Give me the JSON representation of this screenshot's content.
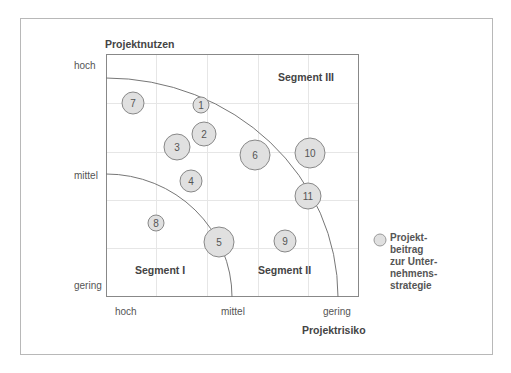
{
  "y_axis": {
    "title": "Projektnutzen",
    "ticks": [
      "hoch",
      "mittel",
      "gering"
    ]
  },
  "x_axis": {
    "title": "Projektrisiko",
    "ticks": [
      "hoch",
      "mittel",
      "gering"
    ]
  },
  "segments": [
    "Segment I",
    "Segment II",
    "Segment III"
  ],
  "legend": {
    "lines": [
      "Projekt-",
      "beitrag",
      "zur Unter-",
      "nehmens-",
      "strategie"
    ]
  },
  "projects": [
    {
      "id": "1",
      "cx": 201,
      "cy": 105,
      "r": 8
    },
    {
      "id": "2",
      "cx": 204,
      "cy": 134,
      "r": 12
    },
    {
      "id": "3",
      "cx": 177,
      "cy": 147,
      "r": 13
    },
    {
      "id": "4",
      "cx": 191,
      "cy": 181,
      "r": 11
    },
    {
      "id": "5",
      "cx": 219,
      "cy": 242,
      "r": 15
    },
    {
      "id": "6",
      "cx": 255,
      "cy": 155,
      "r": 15
    },
    {
      "id": "7",
      "cx": 133,
      "cy": 103,
      "r": 11
    },
    {
      "id": "8",
      "cx": 156,
      "cy": 223,
      "r": 8
    },
    {
      "id": "9",
      "cx": 285,
      "cy": 241,
      "r": 11
    },
    {
      "id": "10",
      "cx": 310,
      "cy": 153,
      "r": 15
    },
    {
      "id": "11",
      "cx": 308,
      "cy": 196,
      "r": 13
    }
  ],
  "colors": {
    "bubble_fill": "#e0e0e0",
    "bubble_stroke": "#888888",
    "line": "#777777",
    "grid": "#e6e6e6"
  }
}
